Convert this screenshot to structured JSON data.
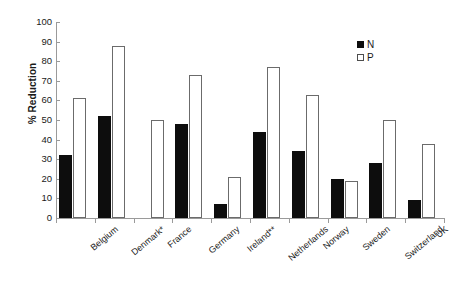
{
  "chart_data": {
    "type": "bar",
    "title": "",
    "subtitle": "",
    "xlabel": "",
    "ylabel": "% Reduction",
    "ylim": [
      0,
      100
    ],
    "yticks": [
      0,
      10,
      20,
      30,
      40,
      50,
      60,
      70,
      80,
      90,
      100
    ],
    "grid": false,
    "legend_position": "top-right",
    "categories": [
      "Belgium",
      "Denmark*",
      "France",
      "Germany",
      "Ireland**",
      "Netherlands",
      "Norway",
      "Sweden",
      "Switzerland",
      "UK"
    ],
    "series": [
      {
        "name": "N",
        "color": "#0d0d0d",
        "values": [
          32,
          52,
          null,
          48,
          7,
          44,
          34,
          20,
          28,
          9
        ]
      },
      {
        "name": "P",
        "color": "#ffffff",
        "values": [
          61,
          88,
          50,
          73,
          21,
          77,
          63,
          19,
          50,
          38
        ]
      }
    ]
  },
  "legend": {
    "items": [
      {
        "label": "N",
        "swatch": "filled-square-icon"
      },
      {
        "label": "P",
        "swatch": "open-square-icon"
      }
    ]
  },
  "axis": {
    "y_title": "% Reduction"
  }
}
